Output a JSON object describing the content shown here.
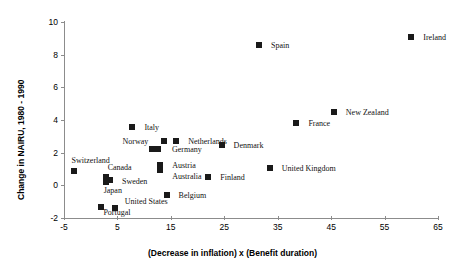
{
  "chart_data": {
    "type": "scatter",
    "title": "",
    "xlabel": "(Decrease in inflation) x (Benefit duration)",
    "ylabel": "Change in NAIRU, 1980 - 1990",
    "xlim": [
      -5,
      65
    ],
    "ylim": [
      -2,
      10
    ],
    "xticks": [
      -5,
      5,
      15,
      25,
      35,
      45,
      55,
      65
    ],
    "yticks": [
      -2,
      0,
      2,
      4,
      6,
      8,
      10
    ],
    "grid": false,
    "legend": "none",
    "marker_color": "#1a1a1a",
    "axis_color": "#8c8c8c",
    "points": [
      {
        "label": "Ireland",
        "x": 60.0,
        "y": 9.1,
        "lx": 12,
        "ly": -4
      },
      {
        "label": "Spain",
        "x": 31.5,
        "y": 8.6,
        "lx": 12,
        "ly": -4
      },
      {
        "label": "New Zealand",
        "x": 45.5,
        "y": 4.5,
        "lx": 12,
        "ly": -4
      },
      {
        "label": "France",
        "x": 38.5,
        "y": 3.8,
        "lx": 12,
        "ly": -4
      },
      {
        "label": "Italy",
        "x": 7.8,
        "y": 3.6,
        "lx": 12,
        "ly": -4
      },
      {
        "label": "Netherlands",
        "x": 16.0,
        "y": 2.7,
        "lx": 12,
        "ly": -4
      },
      {
        "label": "Norway",
        "x": 13.8,
        "y": 2.7,
        "lx": -42,
        "ly": -4
      },
      {
        "label": "Denmark",
        "x": 24.5,
        "y": 2.5,
        "lx": 12,
        "ly": -4
      },
      {
        "label": "Germany",
        "x": 12.6,
        "y": 2.25,
        "lx": 14,
        "ly": -4
      },
      {
        "label": "",
        "x": 11.4,
        "y": 2.25,
        "lx": 0,
        "ly": 0
      },
      {
        "label": "Austria",
        "x": 13.0,
        "y": 1.25,
        "lx": 12,
        "ly": -4
      },
      {
        "label": "Australia",
        "x": 13.0,
        "y": 0.95,
        "lx": 12,
        "ly": 2
      },
      {
        "label": "Switzerland",
        "x": -3.2,
        "y": 0.85,
        "lx": -2,
        "ly": -15
      },
      {
        "label": "United Kingdom",
        "x": 33.5,
        "y": 1.05,
        "lx": 12,
        "ly": -4
      },
      {
        "label": "Finland",
        "x": 22.0,
        "y": 0.5,
        "lx": 12,
        "ly": -4
      },
      {
        "label": "Canada",
        "x": 2.8,
        "y": 0.5,
        "lx": 2,
        "ly": -14
      },
      {
        "label": "Sweden",
        "x": 3.6,
        "y": 0.35,
        "lx": 12,
        "ly": -3
      },
      {
        "label": "Japan",
        "x": 2.8,
        "y": 0.2,
        "lx": -2,
        "ly": 4
      },
      {
        "label": "Belgium",
        "x": 14.2,
        "y": -0.6,
        "lx": 12,
        "ly": -4
      },
      {
        "label": "United States",
        "x": 4.5,
        "y": -1.4,
        "lx": 10,
        "ly": -11
      },
      {
        "label": "Portugal",
        "x": 2.0,
        "y": -1.35,
        "lx": 2,
        "ly": 1
      }
    ]
  }
}
